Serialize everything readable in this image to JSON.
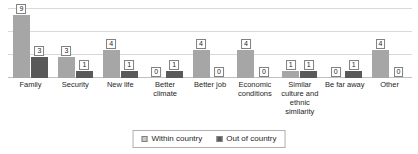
{
  "chart_data": {
    "type": "bar",
    "title": "",
    "xlabel": "",
    "ylabel": "",
    "ylim": [
      0,
      10
    ],
    "grid": true,
    "legend_position": "bottom",
    "categories": [
      "Family",
      "Security",
      "New life",
      "Better climate",
      "Better job",
      "Economic conditions",
      "Similar culture and ethnic similarity",
      "Be far away",
      "Other"
    ],
    "series": [
      {
        "name": "Within country",
        "color": "#a6a6a6",
        "values": [
          9,
          3,
          4,
          0,
          4,
          4,
          1,
          0,
          4
        ]
      },
      {
        "name": "Out of country",
        "color": "#595959",
        "values": [
          3,
          1,
          1,
          1,
          0,
          0,
          1,
          1,
          0
        ]
      }
    ]
  },
  "legend": {
    "entries": [
      {
        "label": "Within country",
        "swatch": "within"
      },
      {
        "label": "Out of country",
        "swatch": "out"
      }
    ]
  },
  "colors": {
    "within_country": "#a6a6a6",
    "out_of_country": "#595959",
    "gridline": "#d9d9d9",
    "label_border": "#808080",
    "background": "#ffffff"
  }
}
